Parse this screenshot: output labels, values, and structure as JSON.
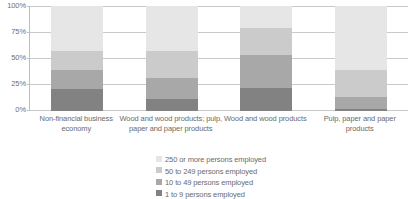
{
  "chart_data": {
    "type": "bar",
    "subtype": "100% stacked column",
    "title": "",
    "subtitle": "",
    "xlabel": "",
    "ylabel": "",
    "ylim": [
      0,
      100
    ],
    "yunit": "%",
    "grid": true,
    "legend_position": "bottom",
    "categories": [
      "Non-financial business economy",
      "Wood and wood products; pulp, paper and paper products",
      "Wood and wood products",
      "Pulp, paper and paper products"
    ],
    "y_ticks": [
      "0%",
      "25%",
      "50%",
      "75%",
      "100%"
    ],
    "y_tick_values": [
      0,
      25,
      50,
      75,
      100
    ],
    "series": [
      {
        "name": "1 to 9 persons employed",
        "color": "#828282",
        "values": [
          21,
          11,
          22,
          2
        ]
      },
      {
        "name": "10 to 49 persons employed",
        "color": "#a8a8a8",
        "values": [
          18,
          20,
          31,
          11
        ]
      },
      {
        "name": "50 to 249 persons employed",
        "color": "#cbcbcb",
        "values": [
          18,
          26,
          26,
          26
        ]
      },
      {
        "name": "250 or more persons employed",
        "color": "#e6e6e6",
        "values": [
          43,
          43,
          21,
          61
        ]
      }
    ],
    "cumulative_tops": [
      [
        21,
        39,
        57,
        100
      ],
      [
        11,
        31,
        57,
        100
      ],
      [
        22,
        53,
        79,
        100
      ],
      [
        2,
        13,
        39,
        100
      ]
    ]
  },
  "axis": {
    "y_labels": [
      {
        "text": "100%",
        "value": 100
      },
      {
        "text": "75%",
        "value": 75
      },
      {
        "text": "50%",
        "value": 50
      },
      {
        "text": "25%",
        "value": 25
      },
      {
        "text": "0%",
        "value": 0
      }
    ]
  },
  "legend": {
    "items": [
      {
        "label": "250 or more persons employed",
        "color": "#e6e6e6"
      },
      {
        "label": "50 to 249 persons employed",
        "color": "#cbcbcb"
      },
      {
        "label": "10 to 49 persons employed",
        "color": "#a8a8a8"
      },
      {
        "label": "1 to 9 persons employed",
        "color": "#828282"
      }
    ]
  }
}
